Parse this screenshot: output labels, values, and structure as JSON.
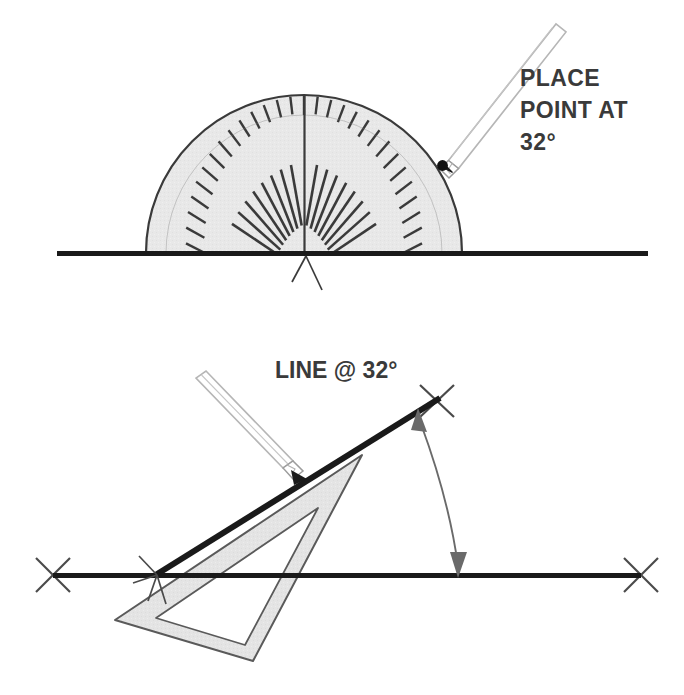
{
  "figure": {
    "panels": [
      {
        "id": "panel-top",
        "name": "protractor-step",
        "annotation_lines": [
          "PLACE",
          "POINT AT",
          "32°"
        ],
        "angle_value": "32°",
        "instruments": [
          "protractor",
          "pencil"
        ]
      },
      {
        "id": "panel-bottom",
        "name": "triangle-step",
        "annotation_lines": [
          "LINE @ 32°"
        ],
        "angle_value": "32°",
        "instruments": [
          "set-square",
          "pencil"
        ]
      }
    ]
  },
  "top_panel": {
    "annotation": {
      "line1": "PLACE",
      "line2": "POINT AT",
      "line3": "32°"
    },
    "protractor": {
      "name": "protractor",
      "center_x": 304,
      "center_y": 253,
      "radius": 158,
      "fill_color": "#e8e8e8",
      "stroke_color": "#3a3a3a",
      "tick_count": 18,
      "tick_interval_degrees": 10,
      "center_line": true
    },
    "baseline": {
      "name": "reference-baseline",
      "x1": 57,
      "x2": 648,
      "y": 253,
      "color": "#1a1a1a",
      "thickness": 5
    },
    "point_mark": {
      "name": "marked-point",
      "x": 443,
      "y": 165,
      "angle_degrees": 32
    },
    "center_cross": {
      "name": "center-crosshair",
      "x": 306,
      "y": 257
    }
  },
  "bottom_panel": {
    "annotation": {
      "line1": "LINE @ 32°"
    },
    "baseline": {
      "name": "reference-baseline",
      "x1": 53,
      "x2": 641,
      "y": 575,
      "color": "#1a1a1a",
      "thickness": 5
    },
    "angled_line": {
      "name": "drawn-angled-line",
      "x1": 156,
      "y1": 575,
      "x2": 437,
      "y2": 400,
      "angle_degrees": 32,
      "color": "#1a1a1a",
      "thickness": 6
    },
    "set_square": {
      "name": "set-square-triangle",
      "fill_color": "#e3e3e3",
      "stroke_color": "#5a5a5a"
    },
    "angle_arc": {
      "name": "angle-dimension-arc",
      "label": "32°",
      "double_headed": true,
      "color": "#6a6a6a"
    },
    "x_marks": {
      "name": "endpoint-cross-marks",
      "positions": [
        {
          "x": 53,
          "y": 575
        },
        {
          "x": 641,
          "y": 575
        },
        {
          "x": 437,
          "y": 400
        },
        {
          "x": 156,
          "y": 575
        }
      ]
    }
  },
  "colors": {
    "ink": "#1a1a1a",
    "instrument_fill": "#e8e8e8",
    "instrument_stroke": "#4a4a4a",
    "text": "#3a3a3a",
    "arc": "#6a6a6a",
    "background": "#ffffff"
  }
}
